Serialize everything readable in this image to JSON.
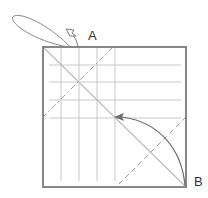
{
  "diagram": {
    "type": "origami-fold-diagram",
    "labels": {
      "a": "A",
      "b": "B"
    },
    "colors": {
      "outline": "#7a7a7a",
      "grid": "#c8c8c8",
      "fold_line": "#bdbdbd",
      "mountain_fold": "#9a9a9a",
      "valley_fold": "#9a9a9a",
      "arrow": "#6e6e6e",
      "label": "#333333"
    },
    "square": {
      "x": 43,
      "y": 47,
      "size": 143
    },
    "grid_vertical_x": [
      61,
      79,
      97,
      115
    ],
    "grid_horizontal_y": [
      65,
      82,
      100,
      118
    ]
  }
}
